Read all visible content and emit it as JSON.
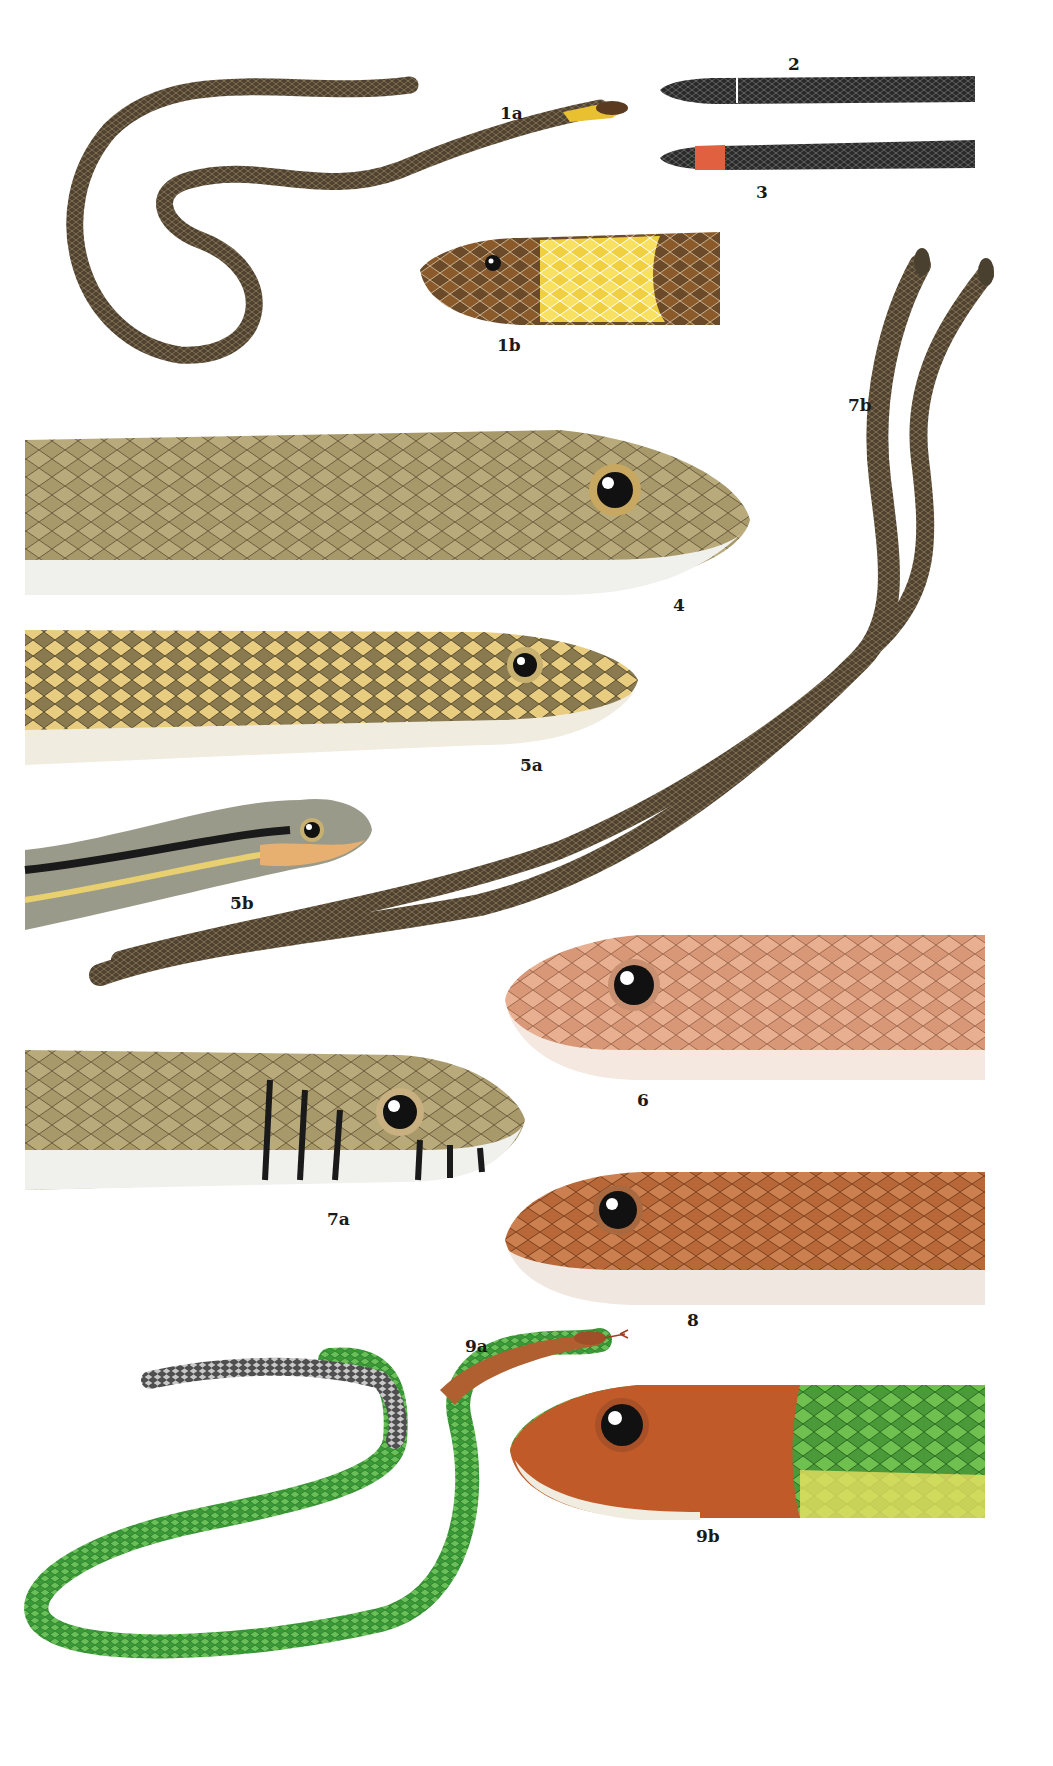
{
  "plate": {
    "background": "#ffffff",
    "figures": [
      {
        "id": "1a",
        "label": "1a",
        "description": "Dark brown slender snake, full body coiled, with yellow collar behind head",
        "colors": {
          "body": "#5a4a35",
          "collar": "#e8c030"
        }
      },
      {
        "id": "1b",
        "label": "1b",
        "description": "Head detail, brown head with yellow collar band",
        "colors": {
          "head": "#8a5a2a",
          "collar": "#f0d040"
        }
      },
      {
        "id": "2",
        "label": "2",
        "description": "Black snake head/neck with thin white collar line",
        "colors": {
          "body": "#2a2a2a",
          "collar": "#ffffff"
        }
      },
      {
        "id": "3",
        "label": "3",
        "description": "Black snake head/neck with orange-red collar",
        "colors": {
          "body": "#2a2a2a",
          "collar": "#e06040"
        }
      },
      {
        "id": "4",
        "label": "4",
        "description": "Olive-tan snake head in lateral view",
        "colors": {
          "body": "#a89a6a",
          "belly": "#f0f0ec"
        }
      },
      {
        "id": "5a",
        "label": "5a",
        "description": "Olive snake head with yellowish scales",
        "colors": {
          "body": "#a0905a",
          "belly": "#f0ece0"
        }
      },
      {
        "id": "5b",
        "label": "5b",
        "description": "Striped juvenile snake head with black and yellow stripes",
        "colors": {
          "body": "#9a9a8a",
          "stripe": "#1a1a1a",
          "lip": "#e8b070"
        }
      },
      {
        "id": "6",
        "label": "6",
        "description": "Pale pinkish-salmon snake head",
        "colors": {
          "body": "#e0a888",
          "belly": "#f4e8e0"
        }
      },
      {
        "id": "7a",
        "label": "7a",
        "description": "Olive snake head with black vertical labial bars",
        "colors": {
          "body": "#a09060",
          "bars": "#1a1a1a"
        }
      },
      {
        "id": "7b",
        "label": "7b",
        "description": "Two intertwined dark olive snakes climbing vertically",
        "colors": {
          "body": "#5a5240"
        }
      },
      {
        "id": "8",
        "label": "8",
        "description": "Rusty-orange snake head",
        "colors": {
          "body": "#c07040",
          "belly": "#f0e8e0"
        }
      },
      {
        "id": "9a",
        "label": "9a",
        "description": "Green snake full body with reddish head and grey-black tail",
        "colors": {
          "body": "#4aa040",
          "head": "#b06030",
          "tail": "#505050"
        }
      },
      {
        "id": "9b",
        "label": "9b",
        "description": "Head detail, orange-red head transitioning to green body",
        "colors": {
          "head": "#c05a28",
          "body": "#6ac040",
          "belly": "#e8e060"
        }
      }
    ]
  }
}
